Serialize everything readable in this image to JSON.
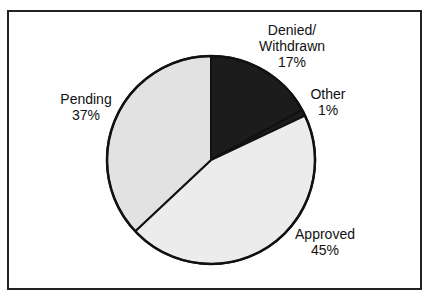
{
  "chart_data": {
    "type": "pie",
    "title": "",
    "start_angle_deg": 0,
    "direction": "clockwise",
    "categories": [
      "Denied/Withdrawn",
      "Other",
      "Approved",
      "Pending"
    ],
    "values": [
      17,
      1,
      45,
      37
    ],
    "unit": "%",
    "slices": [
      {
        "label_lines": [
          "Denied/",
          "Withdrawn"
        ],
        "value": 17,
        "value_label": "17%",
        "color": "#1c1c1c"
      },
      {
        "label_lines": [
          "Other"
        ],
        "value": 1,
        "value_label": "1%",
        "color": "#1c1c1c"
      },
      {
        "label_lines": [
          "Approved"
        ],
        "value": 45,
        "value_label": "45%",
        "color": "#ececec"
      },
      {
        "label_lines": [
          "Pending"
        ],
        "value": 37,
        "value_label": "37%",
        "color": "#e2e2e2"
      }
    ],
    "legend": "none (direct labels)",
    "grid": false
  },
  "colors": {
    "outline": "#111111",
    "frame": "#222222",
    "background": "#ffffff"
  }
}
